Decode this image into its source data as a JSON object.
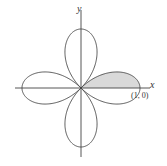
{
  "chart_data": {
    "type": "line",
    "title": "",
    "curve": "polar rose r = cos(2θ)",
    "petals": 4,
    "xlabel": "x",
    "ylabel": "y",
    "annotations": [
      {
        "text": "(1, 0)",
        "x": 1,
        "y": 0
      }
    ],
    "shaded_region": {
      "theta_from": 0,
      "theta_to": 0.7854,
      "description": "upper half of right petal"
    },
    "grid": false,
    "xlim": [
      -1.15,
      1.15
    ],
    "ylim": [
      -1.15,
      1.15
    ]
  },
  "labels": {
    "x_axis": "x",
    "y_axis": "y",
    "point": "(1, 0)"
  },
  "colors": {
    "curve": "#444444",
    "shade": "#d9d9d9",
    "axis": "#444444"
  }
}
